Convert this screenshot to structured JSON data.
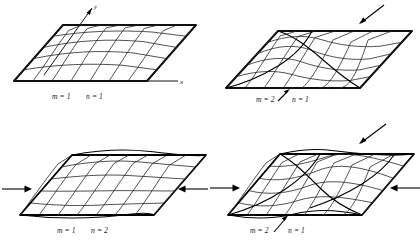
{
  "figure": {
    "background_color": "#ffffff",
    "line_color": "#000000",
    "mesh_color": "#262626",
    "panel_count": 4,
    "panels": [
      {
        "id": "panel-1",
        "position": "top-left",
        "mode_label": "m = 1   n = 1",
        "m_label": "m = 1",
        "n_label": "n = 1",
        "m_value": 1,
        "n_value": 1,
        "axis_x_label": "x",
        "axis_y_label": "y",
        "has_axes": true,
        "load_arrows": []
      },
      {
        "id": "panel-2",
        "position": "top-right",
        "mode_label": "m = 2   n = 1",
        "m_label": "m = 2",
        "n_label": "n = 1",
        "m_value": 2,
        "n_value": 1,
        "axis_x_label": "",
        "axis_y_label": "",
        "has_axes": false,
        "load_arrows": [
          "upper-right-diagonal",
          "label-pointer"
        ]
      },
      {
        "id": "panel-3",
        "position": "bottom-left",
        "mode_label": "m = 1   n = 2",
        "m_label": "m = 1",
        "n_label": "n = 2",
        "m_value": 1,
        "n_value": 2,
        "axis_x_label": "",
        "axis_y_label": "",
        "has_axes": false,
        "load_arrows": [
          "left-inward",
          "right-inward"
        ]
      },
      {
        "id": "panel-4",
        "position": "bottom-right",
        "mode_label": "m = 2   n = 1",
        "m_label": "m = 2",
        "n_label": "n = 1",
        "m_value": 2,
        "n_value": 1,
        "axis_x_label": "",
        "axis_y_label": "",
        "has_axes": false,
        "load_arrows": [
          "left-inward",
          "right-inward",
          "upper-right-diagonal",
          "label-pointer"
        ]
      }
    ]
  }
}
